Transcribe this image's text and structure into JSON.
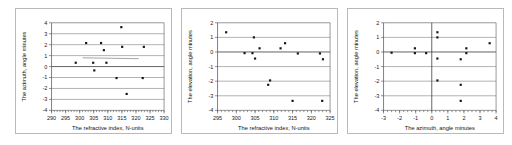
{
  "figure": {
    "panel_count": 3,
    "background_color": "#ffffff",
    "frame_color": "#b9b9b9",
    "marker_color": "#151515",
    "grid_color": "#7d7d7d"
  },
  "chart_data": [
    {
      "id": "chart-1",
      "type": "scatter",
      "title": "",
      "xlabel": "The refractive index, N-units",
      "ylabel": "The azimuth, angle minutes",
      "xlim": [
        290,
        330
      ],
      "ylim": [
        -4,
        4
      ],
      "xticks": [
        290,
        295,
        300,
        305,
        310,
        315,
        320,
        325,
        330
      ],
      "xtick_labels": [
        "290",
        "295",
        "300",
        "305",
        "310",
        "315",
        "320",
        "325",
        "330"
      ],
      "yticks": [
        -4,
        -3,
        -2,
        -1,
        0,
        1,
        2,
        3,
        4
      ],
      "ytick_labels": [
        "-4",
        "-3",
        "-2",
        "-1",
        "0",
        "1",
        "2",
        "3",
        "4"
      ],
      "xminor_step": 1,
      "grid": "horizontal",
      "legend": "none",
      "points": [
        {
          "x": 298.6,
          "y": 0.35
        },
        {
          "x": 302.3,
          "y": 2.15
        },
        {
          "x": 304.8,
          "y": 0.35
        },
        {
          "x": 305.2,
          "y": -0.35
        },
        {
          "x": 307.6,
          "y": 2.15
        },
        {
          "x": 308.6,
          "y": 1.5
        },
        {
          "x": 309.5,
          "y": 0.35
        },
        {
          "x": 313.1,
          "y": -1.05
        },
        {
          "x": 314.8,
          "y": 3.6
        },
        {
          "x": 315.1,
          "y": 1.8
        },
        {
          "x": 316.7,
          "y": -2.5
        },
        {
          "x": 322.4,
          "y": -1.05
        },
        {
          "x": 322.8,
          "y": 1.8
        }
      ],
      "trendline": {
        "x_start": 301.0,
        "y_start": 0.8,
        "x_end": 321.0,
        "y_end": 0.72
      }
    },
    {
      "id": "chart-2",
      "type": "scatter",
      "title": "",
      "xlabel": "The refractive index, N-units",
      "ylabel": "The elevation, angle minutes",
      "xlim": [
        295,
        325
      ],
      "ylim": [
        -4,
        2
      ],
      "xticks": [
        295,
        300,
        305,
        310,
        315,
        320,
        325
      ],
      "xtick_labels": [
        "295",
        "300",
        "305",
        "310",
        "315",
        "320",
        "325"
      ],
      "yticks": [
        -4,
        -3,
        -2,
        -1,
        0,
        1,
        2
      ],
      "ytick_labels": [
        "-4",
        "-3",
        "-2",
        "-1",
        "0",
        "1",
        "2"
      ],
      "xminor_step": 1,
      "grid": "horizontal",
      "legend": "none",
      "points": [
        {
          "x": 297.3,
          "y": 1.35
        },
        {
          "x": 302.2,
          "y": -0.08
        },
        {
          "x": 304.3,
          "y": -0.08
        },
        {
          "x": 304.7,
          "y": 1.0
        },
        {
          "x": 305.0,
          "y": -0.45
        },
        {
          "x": 306.2,
          "y": 0.25
        },
        {
          "x": 308.5,
          "y": -2.25
        },
        {
          "x": 309.0,
          "y": -1.95
        },
        {
          "x": 311.8,
          "y": 0.25
        },
        {
          "x": 313.0,
          "y": 0.6
        },
        {
          "x": 315.0,
          "y": -3.35
        },
        {
          "x": 316.4,
          "y": -0.1
        },
        {
          "x": 322.3,
          "y": -0.1
        },
        {
          "x": 322.9,
          "y": -3.35
        },
        {
          "x": 323.1,
          "y": -0.5
        }
      ]
    },
    {
      "id": "chart-3",
      "type": "scatter",
      "title": "",
      "xlabel": "The azimuth, angle minutes",
      "ylabel": "The elevation, angle minutes",
      "xlim": [
        -3,
        4
      ],
      "ylim": [
        -4,
        2
      ],
      "xticks": [
        -3,
        -2,
        -1,
        0,
        1,
        2,
        3,
        4
      ],
      "xtick_labels": [
        "-3",
        "-2",
        "-1",
        "0",
        "1",
        "2",
        "3",
        "4"
      ],
      "yticks": [
        -4,
        -3,
        -2,
        -1,
        0,
        1,
        2
      ],
      "ytick_labels": [
        "-4",
        "-3",
        "-2",
        "-1",
        "0",
        "1",
        "2"
      ],
      "xminor_step": 0.25,
      "grid": "horizontal",
      "vertical_zero_line": true,
      "legend": "none",
      "points": [
        {
          "x": -2.5,
          "y": -0.05
        },
        {
          "x": -1.05,
          "y": 0.25
        },
        {
          "x": -1.05,
          "y": -0.08
        },
        {
          "x": -0.35,
          "y": -0.08
        },
        {
          "x": 0.35,
          "y": 1.35
        },
        {
          "x": 0.35,
          "y": 1.0
        },
        {
          "x": 0.35,
          "y": -0.45
        },
        {
          "x": 0.35,
          "y": -1.95
        },
        {
          "x": 1.8,
          "y": -2.25
        },
        {
          "x": 1.8,
          "y": -3.35
        },
        {
          "x": 1.8,
          "y": -0.5
        },
        {
          "x": 2.15,
          "y": 0.25
        },
        {
          "x": 2.15,
          "y": -0.08
        },
        {
          "x": 3.6,
          "y": 0.6
        }
      ]
    }
  ]
}
